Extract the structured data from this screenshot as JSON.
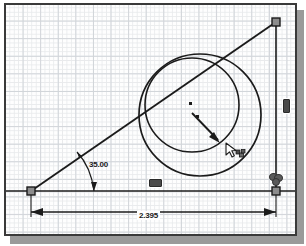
{
  "app": {
    "name": "cad-sketch-canvas",
    "background_color": "#ffffff",
    "frame_color": "#3a3a3a",
    "grid_major_color": "#cfd3d8",
    "grid_minor_color": "#e8eaec",
    "geometry_color": "#1b1b1b"
  },
  "dimensions": {
    "angle": {
      "value": "35.00",
      "kind": "angular-dimension"
    },
    "linear": {
      "value": "2.395",
      "kind": "horizontal-dimension"
    }
  },
  "relations": {
    "horizontal_symbol": "horizontal-relation",
    "vertical_symbol": "vertical-relation",
    "coincident_symbol": "coincident-relation"
  },
  "entities": {
    "line_base": "horizontal-construction-line",
    "line_incline": "inclined-line",
    "line_vertical": "vertical-line",
    "circle_outer": "outer-circle",
    "circle_inner": "inner-circle",
    "point_outer_center": "outer-circle-center-point",
    "point_inner_center": "inner-circle-center-point",
    "endpoint_left": "left-endpoint-handle",
    "endpoint_top_right": "top-right-endpoint-handle",
    "endpoint_bottom_right": "bottom-right-endpoint-handle"
  },
  "pointer": {
    "tool": "circle-drag-cursor"
  }
}
